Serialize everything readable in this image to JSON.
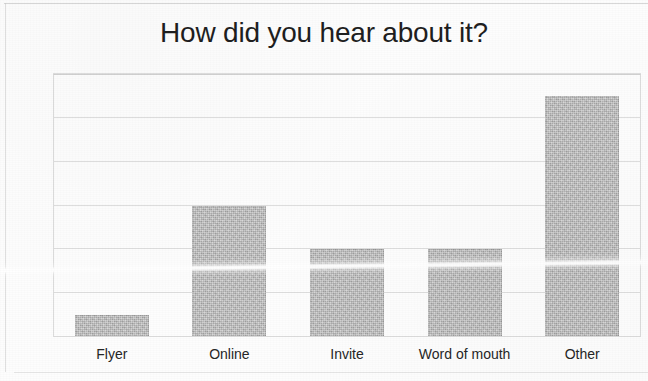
{
  "chart_data": {
    "type": "bar",
    "title": "How did you hear about it?",
    "xlabel": "",
    "ylabel": "",
    "categories": [
      "Flyer",
      "Online",
      "Invite",
      "Word of mouth",
      "Other"
    ],
    "values": [
      1,
      6,
      4,
      4,
      11
    ],
    "ylim": [
      0,
      12
    ],
    "ytick_labels": [
      "0",
      "2",
      "4",
      "6",
      "8",
      "10",
      "12"
    ],
    "ytick_values": [
      0,
      2,
      4,
      6,
      8,
      10,
      12
    ],
    "grid": true,
    "legend": false,
    "legend_position": "none",
    "series": [
      {
        "name": "Responses",
        "values": [
          1,
          6,
          4,
          4,
          11
        ]
      }
    ],
    "bar_color": "#bdbdbd",
    "gridline_color": "#d8d8d8",
    "title_color": "#1f1f1f",
    "background_color": "#ffffff"
  },
  "annotations": {
    "scan_artifact": "horizontal white fold crease across lower plot area"
  }
}
